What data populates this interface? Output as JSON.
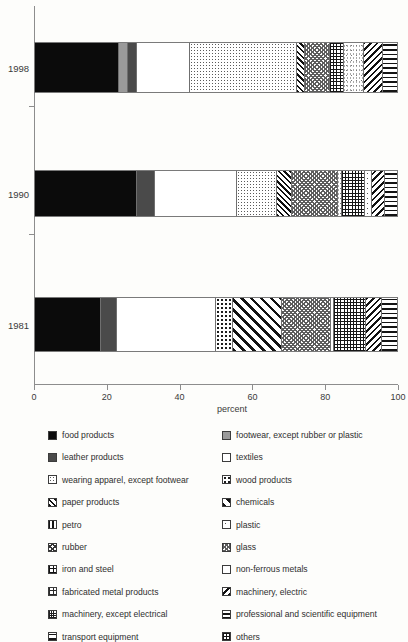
{
  "chart_data": {
    "type": "bar",
    "orientation": "horizontal",
    "stacked": true,
    "title": "",
    "xlabel": "percent",
    "ylabel": "",
    "xlim": [
      0,
      100
    ],
    "xticks": [
      0,
      20,
      40,
      60,
      80,
      100
    ],
    "categories": [
      "1998",
      "1990",
      "1981"
    ],
    "grid": false,
    "legend_position": "below",
    "series": [
      {
        "name": "food products",
        "pattern": "p-black",
        "values": [
          23.2,
          28.2,
          18.0
        ]
      },
      {
        "name": "footwear, except rubber or plastic",
        "pattern": "p-ltgray",
        "values": [
          2.5,
          0.0,
          0.0
        ]
      },
      {
        "name": "leather products",
        "pattern": "p-dkgray",
        "values": [
          2.5,
          5.0,
          4.4
        ]
      },
      {
        "name": "textiles",
        "pattern": "p-white",
        "values": [
          14.6,
          22.7,
          27.3
        ]
      },
      {
        "name": "wearing apparel, except footwear",
        "pattern": "p-dots-sm",
        "values": [
          29.6,
          11.0,
          0.0
        ]
      },
      {
        "name": "wood products",
        "pattern": "p-dots-md",
        "values": [
          0.0,
          0.0,
          4.7
        ]
      },
      {
        "name": "paper products",
        "pattern": "p-diag-thin",
        "values": [
          2.2,
          4.1,
          0.0
        ]
      },
      {
        "name": "chemicals",
        "pattern": "p-diag-wide",
        "values": [
          0.0,
          0.0,
          13.5
        ]
      },
      {
        "name": "petro",
        "pattern": "p-checker",
        "values": [
          6.9,
          12.7,
          13.5
        ]
      },
      {
        "name": "plastic",
        "pattern": "p-sparse",
        "values": [
          0.0,
          1.9,
          0.8
        ]
      },
      {
        "name": "rubber",
        "pattern": "p-grid",
        "values": [
          3.9,
          6.4,
          8.8
        ]
      },
      {
        "name": "glass",
        "pattern": "p-speckle",
        "values": [
          5.5,
          1.1,
          0.0
        ]
      },
      {
        "name": "iron and steel",
        "pattern": "p-plus",
        "values": [
          0.0,
          0.0,
          0.0
        ]
      },
      {
        "name": "non-ferrous metals",
        "pattern": "p-empty",
        "values": [
          0.0,
          0.0,
          0.0
        ]
      },
      {
        "name": "fabricated metal products",
        "pattern": "p-dotsq",
        "values": [
          0.0,
          0.0,
          0.0
        ]
      },
      {
        "name": "machinery, electric",
        "pattern": "p-diag-back",
        "values": [
          5.2,
          3.6,
          4.4
        ]
      },
      {
        "name": "machinery, except electrical",
        "pattern": "p-x",
        "values": [
          0.0,
          0.0,
          0.0
        ]
      },
      {
        "name": "professional and scientific equipment",
        "pattern": "p-horiz",
        "values": [
          0.0,
          0.0,
          0.0
        ]
      },
      {
        "name": "transport equipment",
        "pattern": "p-horiz-wide",
        "values": [
          3.9,
          3.3,
          4.1
        ]
      },
      {
        "name": "others",
        "pattern": "p-vert",
        "values": [
          0.0,
          0.0,
          0.0
        ]
      }
    ],
    "bars": [
      {
        "category": "1998",
        "segments": [
          {
            "label": "food products",
            "pattern": "p-black",
            "start": 0.0,
            "value": 23.2
          },
          {
            "label": "footwear, except rubber or plastic",
            "pattern": "p-ltgray",
            "start": 23.2,
            "value": 2.5
          },
          {
            "label": "leather products",
            "pattern": "p-dkgray",
            "start": 25.7,
            "value": 2.5
          },
          {
            "label": "textiles",
            "pattern": "p-white",
            "start": 28.2,
            "value": 14.6
          },
          {
            "label": "wearing apparel, except footwear",
            "pattern": "p-dots-sm",
            "start": 42.8,
            "value": 29.6
          },
          {
            "label": "paper products",
            "pattern": "p-diag-thin",
            "start": 72.4,
            "value": 2.2
          },
          {
            "label": "petro",
            "pattern": "p-checker",
            "start": 74.6,
            "value": 6.9
          },
          {
            "label": "rubber",
            "pattern": "p-grid",
            "start": 81.5,
            "value": 3.9
          },
          {
            "label": "glass",
            "pattern": "p-speckle",
            "start": 85.4,
            "value": 5.5
          },
          {
            "label": "machinery, electric",
            "pattern": "p-diag-back",
            "start": 90.9,
            "value": 5.2
          },
          {
            "label": "transport equipment",
            "pattern": "p-horiz-wide",
            "start": 96.1,
            "value": 3.9
          }
        ]
      },
      {
        "category": "1990",
        "segments": [
          {
            "label": "food products",
            "pattern": "p-black",
            "start": 0.0,
            "value": 28.2
          },
          {
            "label": "leather products",
            "pattern": "p-dkgray",
            "start": 28.2,
            "value": 5.0
          },
          {
            "label": "textiles",
            "pattern": "p-white",
            "start": 33.2,
            "value": 22.7
          },
          {
            "label": "wearing apparel, except footwear",
            "pattern": "p-dots-sm",
            "start": 55.9,
            "value": 11.0
          },
          {
            "label": "paper products",
            "pattern": "p-diag-thin",
            "start": 66.9,
            "value": 4.1
          },
          {
            "label": "petro",
            "pattern": "p-checker",
            "start": 71.0,
            "value": 12.7
          },
          {
            "label": "glass",
            "pattern": "p-speckle",
            "start": 83.7,
            "value": 1.1
          },
          {
            "label": "rubber",
            "pattern": "p-grid",
            "start": 84.8,
            "value": 6.4
          },
          {
            "label": "plastic",
            "pattern": "p-sparse",
            "start": 91.2,
            "value": 1.9
          },
          {
            "label": "machinery, electric",
            "pattern": "p-diag-back",
            "start": 93.1,
            "value": 3.6
          },
          {
            "label": "transport equipment",
            "pattern": "p-horiz-wide",
            "start": 96.7,
            "value": 3.3
          }
        ]
      },
      {
        "category": "1981",
        "segments": [
          {
            "label": "food products",
            "pattern": "p-black",
            "start": 0.0,
            "value": 18.0
          },
          {
            "label": "leather products",
            "pattern": "p-dkgray",
            "start": 18.0,
            "value": 4.4
          },
          {
            "label": "textiles",
            "pattern": "p-white",
            "start": 22.4,
            "value": 27.3
          },
          {
            "label": "wood products",
            "pattern": "p-dots-md",
            "start": 49.7,
            "value": 4.7
          },
          {
            "label": "chemicals",
            "pattern": "p-diag-wide",
            "start": 54.4,
            "value": 13.5
          },
          {
            "label": "petro",
            "pattern": "p-checker",
            "start": 67.9,
            "value": 13.5
          },
          {
            "label": "plastic",
            "pattern": "p-sparse",
            "start": 81.4,
            "value": 0.8
          },
          {
            "label": "rubber",
            "pattern": "p-grid",
            "start": 82.2,
            "value": 8.8
          },
          {
            "label": "machinery, electric",
            "pattern": "p-diag-back",
            "start": 91.0,
            "value": 4.4
          },
          {
            "label": "transport equipment",
            "pattern": "p-horiz-wide",
            "start": 95.4,
            "value": 4.1
          }
        ]
      }
    ]
  },
  "axis": {
    "x_title": "percent",
    "x_ticks": [
      "0",
      "20",
      "40",
      "60",
      "80",
      "100"
    ],
    "y_ticks": [
      "1998",
      "1990",
      "1981"
    ]
  },
  "legend": {
    "items": [
      {
        "label": "food products",
        "pattern": "p-black"
      },
      {
        "label": "footwear, except rubber or plastic",
        "pattern": "p-ltgray"
      },
      {
        "label": "leather products",
        "pattern": "p-dkgray"
      },
      {
        "label": "textiles",
        "pattern": "p-empty"
      },
      {
        "label": "wearing apparel, except footwear",
        "pattern": "p-dots-sm"
      },
      {
        "label": "wood products",
        "pattern": "p-dots-md"
      },
      {
        "label": "paper products",
        "pattern": "p-diag-thin"
      },
      {
        "label": "chemicals",
        "pattern": "p-diag-wide"
      },
      {
        "label": "petro",
        "pattern": "p-vert"
      },
      {
        "label": "plastic",
        "pattern": "p-sparse"
      },
      {
        "label": "rubber",
        "pattern": "p-x"
      },
      {
        "label": "glass",
        "pattern": "p-checker"
      },
      {
        "label": "iron and steel",
        "pattern": "p-plus"
      },
      {
        "label": "non-ferrous metals",
        "pattern": "p-empty"
      },
      {
        "label": "fabricated metal products",
        "pattern": "p-dotsq"
      },
      {
        "label": "machinery, electric",
        "pattern": "p-diag-back"
      },
      {
        "label": "machinery, except electrical",
        "pattern": "p-grid-fine"
      },
      {
        "label": "professional and scientific equipment",
        "pattern": "p-horiz"
      },
      {
        "label": "transport equipment",
        "pattern": "p-horiz-wide"
      },
      {
        "label": "others",
        "pattern": "p-grid"
      }
    ]
  }
}
